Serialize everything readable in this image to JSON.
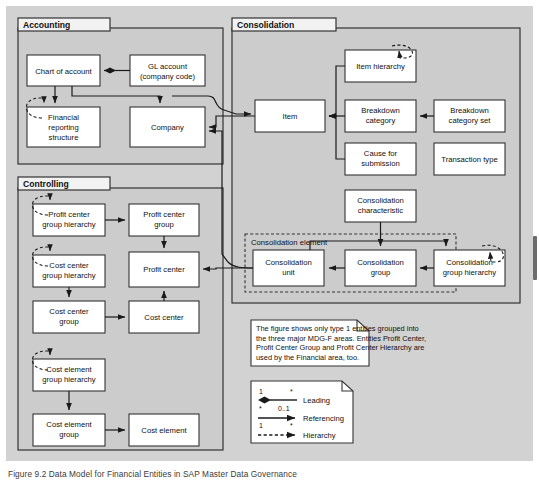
{
  "figure": {
    "caption": "Figure 9.2  Data Model for Financial Entities in SAP Master Data Governance",
    "background_color": "#d4d4d4",
    "panel_color": "#cfcfcf",
    "box_fill": "#ffffff",
    "line_color": "#1a1a1a"
  },
  "groups": [
    {
      "id": "accounting",
      "label": "Accounting"
    },
    {
      "id": "controlling",
      "label": "Controlling"
    },
    {
      "id": "consolidation",
      "label": "Consolidation"
    }
  ],
  "accounting": {
    "title": "Accounting",
    "entities": [
      {
        "id": "chart-of-account",
        "label": "Chart of account"
      },
      {
        "id": "gl-account",
        "label": "GL account\n(company code)",
        "line1": "GL account",
        "line2": "(company code)"
      },
      {
        "id": "financial-reporting-structure",
        "label": "Financial reporting structure",
        "line1": "Financial",
        "line2": "reporting",
        "line3": "structure"
      },
      {
        "id": "company",
        "label": "Company"
      }
    ]
  },
  "controlling": {
    "title": "Controlling",
    "entities": [
      {
        "id": "profit-center-group-hierarchy",
        "line1": "Profit center",
        "line2": "group hierarchy"
      },
      {
        "id": "profit-center-group",
        "line1": "Profit center",
        "line2": "group"
      },
      {
        "id": "cost-center-group-hierarchy",
        "line1": "Cost center",
        "line2": "group hierarchy"
      },
      {
        "id": "profit-center",
        "line1": "Profit center"
      },
      {
        "id": "cost-center-group",
        "line1": "Cost center",
        "line2": "group"
      },
      {
        "id": "cost-center",
        "line1": "Cost center"
      },
      {
        "id": "cost-element-group-hierarchy",
        "line1": "Cost element",
        "line2": "group hierarchy"
      },
      {
        "id": "cost-element-group",
        "line1": "Cost element",
        "line2": "group"
      },
      {
        "id": "cost-element",
        "line1": "Cost element"
      }
    ]
  },
  "consolidation": {
    "title": "Consolidation",
    "sub_group_label": "Consolidation element",
    "entities": [
      {
        "id": "item",
        "line1": "Item"
      },
      {
        "id": "item-hierarchy",
        "line1": "Item hierarchy"
      },
      {
        "id": "breakdown-category",
        "line1": "Breakdown",
        "line2": "category"
      },
      {
        "id": "breakdown-category-set",
        "line1": "Breakdown",
        "line2": "category set"
      },
      {
        "id": "cause-for-submission",
        "line1": "Cause for",
        "line2": "submission"
      },
      {
        "id": "transaction-type",
        "line1": "Transaction type"
      },
      {
        "id": "consolidation-characteristic",
        "line1": "Consolidation",
        "line2": "characteristic"
      },
      {
        "id": "consolidation-unit",
        "line1": "Consolidation",
        "line2": "unit"
      },
      {
        "id": "consolidation-group",
        "line1": "Consolidation",
        "line2": "group"
      },
      {
        "id": "consolidation-group-hierarchy",
        "line1": "Consolidation",
        "line2": "group hierarchy"
      }
    ]
  },
  "note": {
    "lines": [
      "The figure shows only type 1 entities grouped into",
      "the three major MDG-F areas. Entities Profit Center,",
      "Profit Center Group and Profit Center Hierarchy are",
      "used by the Financial area, too."
    ]
  },
  "legend": {
    "rows": [
      {
        "id": "leading",
        "label": "Leading",
        "left_card": "1",
        "right_card": "*",
        "style": "solid-diamond"
      },
      {
        "id": "referencing",
        "label": "Referencing",
        "left_card": "*",
        "right_card": "0..1",
        "style": "solid-arrow"
      },
      {
        "id": "hierarchy",
        "label": "Hierarchy",
        "left_card": "1",
        "right_card": "*",
        "style": "dashed-arrow"
      }
    ]
  }
}
